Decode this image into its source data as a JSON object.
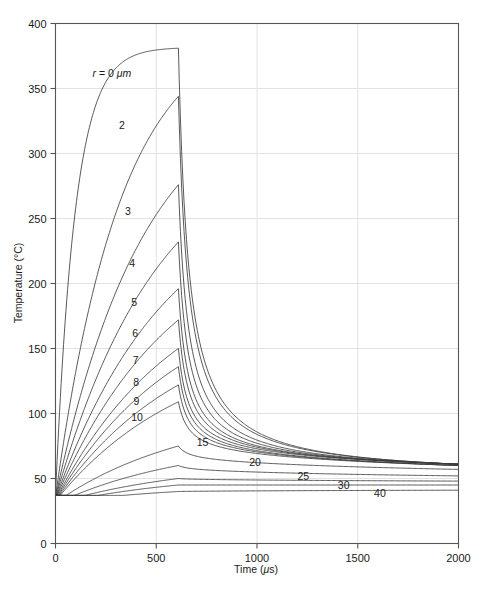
{
  "chart_data": {
    "type": "line",
    "title": "",
    "xlabel": "Time (μs)",
    "ylabel": "Temperature (°C)",
    "xlim": [
      0,
      2000
    ],
    "ylim": [
      0,
      400
    ],
    "xticks": [
      0,
      500,
      1000,
      1500,
      2000
    ],
    "yticks": [
      0,
      50,
      100,
      150,
      200,
      250,
      300,
      350,
      400
    ],
    "xtick_labels": [
      "0",
      "500",
      "1000",
      "1500",
      "2000"
    ],
    "ytick_labels": [
      "0",
      "50",
      "100",
      "150",
      "200",
      "250",
      "300",
      "350",
      "400"
    ],
    "grid": true,
    "legend_position": "inline-curve-labels",
    "baseline_temperature": 37,
    "pulse_end_time": 610,
    "series_parameter": "r",
    "series_parameter_unit": "μm",
    "series": [
      {
        "name": "r = 0 μm",
        "radius": 0,
        "label": "r = 0 μm",
        "label_x": 280,
        "label_y": 362,
        "peak_temp": 381,
        "end_temp": 61
      },
      {
        "name": "2",
        "radius": 2,
        "label": "2",
        "label_x": 330,
        "label_y": 322,
        "peak_temp": 344,
        "end_temp": 61
      },
      {
        "name": "3",
        "radius": 3,
        "label": "3",
        "label_x": 360,
        "label_y": 256,
        "peak_temp": 276,
        "end_temp": 61
      },
      {
        "name": "4",
        "radius": 4,
        "label": "4",
        "label_x": 380,
        "label_y": 216,
        "peak_temp": 232,
        "end_temp": 61
      },
      {
        "name": "5",
        "radius": 5,
        "label": "5",
        "label_x": 390,
        "label_y": 186,
        "peak_temp": 196,
        "end_temp": 61
      },
      {
        "name": "6",
        "radius": 6,
        "label": "6",
        "label_x": 395,
        "label_y": 162,
        "peak_temp": 172,
        "end_temp": 61
      },
      {
        "name": "7",
        "radius": 7,
        "label": "7",
        "label_x": 398,
        "label_y": 141,
        "peak_temp": 150,
        "end_temp": 61
      },
      {
        "name": "8",
        "radius": 8,
        "label": "8",
        "label_x": 400,
        "label_y": 124,
        "peak_temp": 136,
        "end_temp": 60
      },
      {
        "name": "9",
        "radius": 9,
        "label": "9",
        "label_x": 402,
        "label_y": 110,
        "peak_temp": 122,
        "end_temp": 60
      },
      {
        "name": "10",
        "radius": 10,
        "label": "10",
        "label_x": 405,
        "label_y": 97,
        "peak_temp": 109,
        "end_temp": 60
      },
      {
        "name": "15",
        "radius": 15,
        "label": "15",
        "label_x": 730,
        "label_y": 78,
        "peak_temp": 75,
        "end_temp": 57
      },
      {
        "name": "20",
        "radius": 20,
        "label": "20",
        "label_x": 990,
        "label_y": 63,
        "peak_temp": 60,
        "end_temp": 52
      },
      {
        "name": "25",
        "radius": 25,
        "label": "25",
        "label_x": 1230,
        "label_y": 52,
        "peak_temp": 50,
        "end_temp": 48
      },
      {
        "name": "30",
        "radius": 30,
        "label": "30",
        "label_x": 1430,
        "label_y": 45,
        "peak_temp": 45,
        "end_temp": 45
      },
      {
        "name": "40",
        "radius": 40,
        "label": "40",
        "label_x": 1610,
        "label_y": 39,
        "peak_temp": 40,
        "end_temp": 41
      }
    ]
  },
  "figure": {
    "label_r_equals": "r",
    "label_r_rest": " = 0 ",
    "label_r_unit": "μm",
    "xlabel_prefix": "Time (",
    "xlabel_unit": "μ",
    "xlabel_suffix": "s)",
    "ylabel_text": "Temperature (°C)",
    "top_artifact": ""
  }
}
